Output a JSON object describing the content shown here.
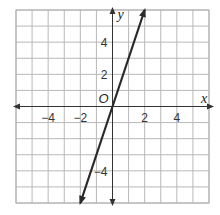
{
  "chart_data": {
    "type": "line",
    "title": "",
    "xlabel": "x",
    "ylabel": "y",
    "origin_label": "O",
    "xlim": [
      -6,
      6
    ],
    "ylim": [
      -6,
      6
    ],
    "grid": true,
    "grid_step": 1,
    "x_ticks": [
      -4,
      -2,
      2,
      4
    ],
    "x_tick_labels": [
      "−4",
      "−2",
      "2",
      "4"
    ],
    "y_ticks": [
      4,
      2,
      -4
    ],
    "y_tick_labels": [
      "4",
      "2",
      "−4"
    ],
    "series": [
      {
        "name": "y = 3x",
        "equation": "y = 3x",
        "x": [
          -2,
          2
        ],
        "y": [
          -6,
          6
        ],
        "arrows": "both",
        "color": "#2a2a2a"
      }
    ],
    "axis_color": "#333333",
    "grid_color": "#b8b8b8"
  }
}
